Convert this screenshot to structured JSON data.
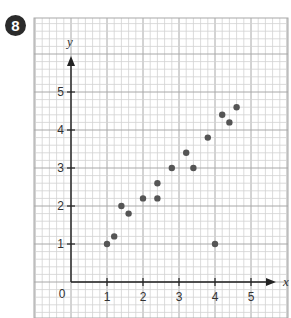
{
  "question_number": "8",
  "chart_data": {
    "type": "scatter",
    "title": "",
    "xlabel": "x",
    "ylabel": "y",
    "xlim": [
      0,
      5.5
    ],
    "ylim": [
      0,
      5.5
    ],
    "x_ticks": [
      "1",
      "2",
      "3",
      "4",
      "5"
    ],
    "y_ticks": [
      "1",
      "2",
      "3",
      "4",
      "5"
    ],
    "origin_label": "0",
    "grid": true,
    "points": [
      {
        "x": 1.0,
        "y": 1.0
      },
      {
        "x": 1.2,
        "y": 1.2
      },
      {
        "x": 1.4,
        "y": 2.0
      },
      {
        "x": 1.6,
        "y": 1.8
      },
      {
        "x": 2.0,
        "y": 2.2
      },
      {
        "x": 2.4,
        "y": 2.2
      },
      {
        "x": 2.4,
        "y": 2.6
      },
      {
        "x": 2.8,
        "y": 3.0
      },
      {
        "x": 3.2,
        "y": 3.4
      },
      {
        "x": 3.4,
        "y": 3.0
      },
      {
        "x": 3.8,
        "y": 3.8
      },
      {
        "x": 4.2,
        "y": 4.4
      },
      {
        "x": 4.4,
        "y": 4.2
      },
      {
        "x": 4.6,
        "y": 4.6
      },
      {
        "x": 4.0,
        "y": 1.0
      }
    ],
    "colors": {
      "point": "#555555",
      "axis": "#222222",
      "grid_minor": "#d2d2d2",
      "grid_major": "#a8a8a8"
    }
  }
}
